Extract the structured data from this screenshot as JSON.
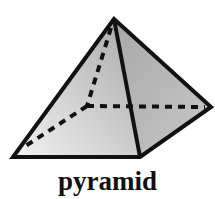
{
  "diagram": {
    "title": "pyramid",
    "shape": "square pyramid",
    "vertices": {
      "apex": [
        114,
        19
      ],
      "front_left": [
        13,
        157
      ],
      "front_right": [
        140,
        157
      ],
      "back_right": [
        211,
        107
      ],
      "back_left_hidden": [
        87,
        106
      ]
    },
    "edges_visible": [
      "apex-front_left",
      "apex-front_right",
      "apex-back_right",
      "front_left-front_right",
      "front_right-back_right"
    ],
    "edges_hidden_dashed": [
      "apex-back_left_hidden",
      "front_left-back_left_hidden",
      "back_left_hidden-back_right"
    ],
    "colors": {
      "edge": "#111111",
      "face_left": "#c8c8c8",
      "face_right": "#b4b4b4",
      "background": "#ffffff"
    }
  }
}
